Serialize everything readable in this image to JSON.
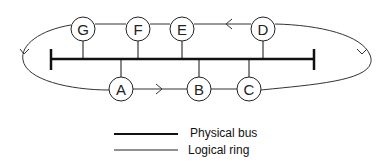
{
  "diagram": {
    "nodes": [
      {
        "id": "G",
        "label": "G",
        "x": 83,
        "y": 29,
        "side": "top"
      },
      {
        "id": "F",
        "label": "F",
        "x": 138,
        "y": 29,
        "side": "top"
      },
      {
        "id": "E",
        "label": "E",
        "x": 182,
        "y": 29,
        "side": "top"
      },
      {
        "id": "D",
        "label": "D",
        "x": 263,
        "y": 29,
        "side": "top"
      },
      {
        "id": "A",
        "label": "A",
        "x": 121,
        "y": 89,
        "side": "bottom"
      },
      {
        "id": "B",
        "label": "B",
        "x": 199,
        "y": 89,
        "side": "bottom"
      },
      {
        "id": "C",
        "label": "C",
        "x": 249,
        "y": 89,
        "side": "bottom"
      }
    ],
    "logical_ring_order": [
      "A",
      "B",
      "C",
      "D",
      "E",
      "F",
      "G",
      "A"
    ],
    "legend": [
      {
        "label": "Physical bus",
        "style": "thick"
      },
      {
        "label": "Logical ring",
        "style": "thin"
      }
    ]
  }
}
